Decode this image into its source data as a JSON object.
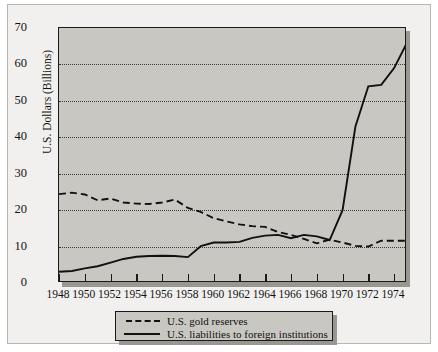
{
  "chart_data": {
    "type": "line",
    "title": "",
    "xlabel": "",
    "ylabel": "U.S. Dollars (Billions)",
    "xlim": [
      1948,
      1975
    ],
    "ylim": [
      0,
      70
    ],
    "yticks": [
      0,
      10,
      20,
      30,
      40,
      50,
      60,
      70
    ],
    "xticks": [
      1948,
      1950,
      1952,
      1954,
      1956,
      1958,
      1960,
      1962,
      1964,
      1966,
      1968,
      1970,
      1972,
      1974
    ],
    "grid": "horizontal-dotted",
    "legend_position": "below-axes",
    "x": [
      1948,
      1949,
      1950,
      1951,
      1952,
      1953,
      1954,
      1955,
      1956,
      1957,
      1958,
      1959,
      1960,
      1961,
      1962,
      1963,
      1964,
      1965,
      1966,
      1967,
      1968,
      1969,
      1970,
      1971,
      1972,
      1973,
      1974,
      1975
    ],
    "series": [
      {
        "name": "U.S. gold reserves",
        "style": "dashed",
        "color": "#111111",
        "values": [
          24.4,
          24.8,
          24.3,
          22.7,
          23.2,
          22.1,
          21.8,
          21.7,
          22.1,
          22.9,
          20.6,
          19.5,
          17.8,
          16.9,
          16.1,
          15.6,
          15.4,
          14.0,
          13.2,
          12.1,
          10.9,
          11.9,
          11.1,
          10.2,
          10.0,
          11.6,
          11.6,
          11.6
        ]
      },
      {
        "name": "U.S. liabilities to foreign institutions",
        "style": "solid",
        "color": "#111111",
        "values": [
          3.1,
          3.3,
          4.0,
          4.6,
          5.6,
          6.6,
          7.2,
          7.4,
          7.5,
          7.4,
          7.1,
          10.1,
          11.1,
          11.1,
          11.3,
          12.4,
          13.0,
          13.2,
          12.3,
          13.2,
          12.8,
          11.8,
          20.0,
          43.0,
          54.0,
          54.4,
          59.0,
          66.0
        ]
      }
    ],
    "annotations": []
  },
  "legend": {
    "entries": [
      {
        "label": "U.S. gold reserves",
        "style": "dashed"
      },
      {
        "label": "U.S. liabilities to foreign institutions",
        "style": "solid"
      }
    ]
  }
}
